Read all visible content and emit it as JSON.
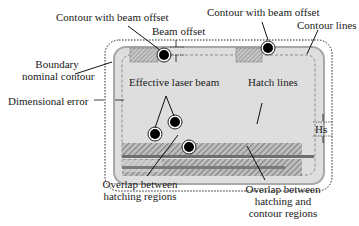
{
  "labels": {
    "contour_beam_offset_left": "Contour with beam offset",
    "contour_beam_offset_right": "Contour with beam offset",
    "beam_offset": "Beam offset",
    "contour_lines": "Contour lines",
    "boundary_line1": "Boundary",
    "boundary_line2": "nominal contour",
    "dimensional_error": "Dimensional error",
    "effective_laser_beam": "Effective laser beam",
    "hatch_lines": "Hatch lines",
    "hs": "Hs",
    "overlap_hatching_line1": "Overlap between",
    "overlap_hatching_line2": "hatching regions",
    "overlap_contour_line1": "Overlap between",
    "overlap_contour_line2": "hatching and",
    "overlap_contour_line3": "contour regions"
  },
  "colors": {
    "outer_dotted": "#222222",
    "part_fill": "#dcdcdc",
    "part_border": "#9a9a9a",
    "hatch_fill": "#8a8a8a",
    "overlap_band": "#6e6e6e",
    "beam": "#000000"
  }
}
